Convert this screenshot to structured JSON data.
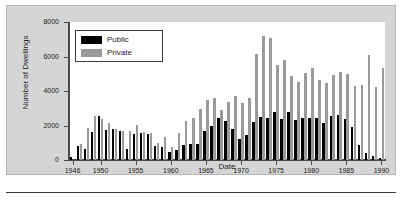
{
  "chart_data": {
    "type": "bar",
    "title": "",
    "xlabel": "Date",
    "ylabel": "Number of Dwellings",
    "ylim": [
      0,
      8000
    ],
    "ytick_labels": [
      "0",
      "2000",
      "4000",
      "6000",
      "8000"
    ],
    "ytick_values": [
      0,
      2000,
      4000,
      6000,
      8000
    ],
    "xtick_labels": [
      "1946",
      "1950",
      "1955",
      "1960",
      "1965",
      "1970",
      "1975",
      "1980",
      "1985",
      "1990"
    ],
    "xtick_values": [
      1946,
      1950,
      1955,
      1960,
      1965,
      1970,
      1975,
      1980,
      1985,
      1990
    ],
    "grid": false,
    "legend_position": "upper-left-inside",
    "categories": [
      1946,
      1947,
      1948,
      1949,
      1950,
      1951,
      1952,
      1953,
      1954,
      1955,
      1956,
      1957,
      1958,
      1959,
      1960,
      1961,
      1962,
      1963,
      1964,
      1965,
      1966,
      1967,
      1968,
      1969,
      1970,
      1971,
      1972,
      1973,
      1974,
      1975,
      1976,
      1977,
      1978,
      1979,
      1980,
      1981,
      1982,
      1983,
      1984,
      1985,
      1986,
      1987,
      1988,
      1989,
      1990
    ],
    "series": [
      {
        "name": "Public",
        "color": "#000000",
        "values": [
          150,
          800,
          650,
          1620,
          2570,
          1760,
          1790,
          1670,
          620,
          1480,
          1580,
          1500,
          800,
          760,
          460,
          560,
          870,
          930,
          950,
          1680,
          1980,
          2420,
          2260,
          1790,
          1240,
          1440,
          2230,
          2510,
          2430,
          2800,
          2380,
          2790,
          2320,
          2440,
          2430,
          2430,
          2130,
          2550,
          2620,
          2370,
          1920,
          880,
          400,
          230,
          120
        ]
      },
      {
        "name": "Private",
        "color": "#9a9a9a",
        "values": [
          0,
          950,
          1870,
          2530,
          2400,
          2140,
          1770,
          1700,
          1680,
          2030,
          1620,
          1550,
          980,
          1320,
          770,
          1570,
          2250,
          2460,
          2980,
          3460,
          3620,
          2900,
          3380,
          3740,
          3320,
          3570,
          6130,
          7210,
          7100,
          5480,
          5790,
          4890,
          4500,
          5020,
          5350,
          4640,
          4450,
          4940,
          5110,
          4960,
          4270,
          4360,
          6080,
          4220,
          5330
        ]
      }
    ]
  },
  "legend": {
    "items": [
      {
        "label": "Public"
      },
      {
        "label": "Private"
      }
    ]
  },
  "figure": {
    "background": "#d5d5d5",
    "panel_background": "#ffffff",
    "axis_color": "#4a4a4a"
  }
}
